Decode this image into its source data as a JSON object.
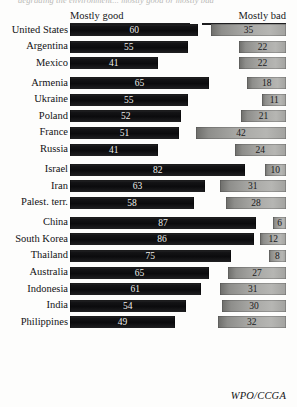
{
  "top_caption": "degrading the environment... mostly good or mostly bad",
  "headers": {
    "good": "Mostly good",
    "bad": "Mostly bad"
  },
  "credit": "WPO/CCGA",
  "colors": {
    "good_bar": "#0b0b0d",
    "bad_bar": "#a7a7a4",
    "background": "#fdfdfc",
    "text": "#121214"
  },
  "chart_data": {
    "type": "bar",
    "title": "",
    "xlabel": "",
    "ylabel": "",
    "xlim": [
      0,
      100
    ],
    "grid": false,
    "orientation": "horizontal",
    "legend_position": "top",
    "series": [
      {
        "name": "Mostly good",
        "color": "#0b0b0d"
      },
      {
        "name": "Mostly bad",
        "color": "#a7a7a4"
      }
    ],
    "groups": [
      {
        "name": "Americas",
        "rows": [
          {
            "label": "United States",
            "good": 60,
            "bad": 35
          },
          {
            "label": "Argentina",
            "good": 55,
            "bad": 22
          },
          {
            "label": "Mexico",
            "good": 41,
            "bad": 22
          }
        ]
      },
      {
        "name": "Europe and Eurasia",
        "rows": [
          {
            "label": "Armenia",
            "good": 65,
            "bad": 18
          },
          {
            "label": "Ukraine",
            "good": 55,
            "bad": 11
          },
          {
            "label": "Poland",
            "good": 52,
            "bad": 21
          },
          {
            "label": "France",
            "good": 51,
            "bad": 42
          },
          {
            "label": "Russia",
            "good": 41,
            "bad": 24
          }
        ]
      },
      {
        "name": "Middle East",
        "rows": [
          {
            "label": "Israel",
            "good": 82,
            "bad": 10
          },
          {
            "label": "Iran",
            "good": 63,
            "bad": 31
          },
          {
            "label": "Palest. terr.",
            "good": 58,
            "bad": 28
          }
        ]
      },
      {
        "name": "Asia and Pacific",
        "rows": [
          {
            "label": "China",
            "good": 87,
            "bad": 6
          },
          {
            "label": "South Korea",
            "good": 86,
            "bad": 12
          },
          {
            "label": "Thailand",
            "good": 75,
            "bad": 8
          },
          {
            "label": "Australia",
            "good": 65,
            "bad": 27
          },
          {
            "label": "Indonesia",
            "good": 61,
            "bad": 31
          },
          {
            "label": "India",
            "good": 54,
            "bad": 30
          },
          {
            "label": "Philippines",
            "good": 49,
            "bad": 32
          }
        ]
      }
    ]
  }
}
